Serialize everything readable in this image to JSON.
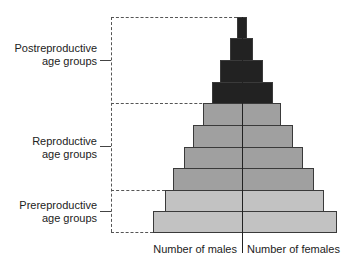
{
  "diagram": {
    "type": "age-structure-pyramid",
    "colors": {
      "postreproductive": "#222222",
      "reproductive": "#a0a0a0",
      "prereproductive": "#c2c2c2",
      "border": "#3a3a3a"
    },
    "groups": [
      {
        "key": "postreproductive",
        "line1": "Postreproductive",
        "line2": "age groups"
      },
      {
        "key": "reproductive",
        "line1": "Reproductive",
        "line2": "age groups"
      },
      {
        "key": "prereproductive",
        "line1": "Prereproductive",
        "line2": "age groups"
      }
    ],
    "axis_labels": {
      "left": "Number of males",
      "right": "Number of females"
    },
    "bars": [
      {
        "group": "postreproductive",
        "left": 237,
        "right": 247,
        "top": 17,
        "bottom": 38
      },
      {
        "group": "postreproductive",
        "left": 230,
        "right": 253,
        "top": 38,
        "bottom": 60
      },
      {
        "group": "postreproductive",
        "left": 220,
        "right": 263,
        "top": 60,
        "bottom": 82
      },
      {
        "group": "postreproductive",
        "left": 212,
        "right": 273,
        "top": 82,
        "bottom": 103
      },
      {
        "group": "reproductive",
        "left": 203,
        "right": 281,
        "top": 103,
        "bottom": 125
      },
      {
        "group": "reproductive",
        "left": 193,
        "right": 293,
        "top": 125,
        "bottom": 147
      },
      {
        "group": "reproductive",
        "left": 184,
        "right": 303,
        "top": 147,
        "bottom": 168
      },
      {
        "group": "reproductive",
        "left": 173,
        "right": 314,
        "top": 168,
        "bottom": 190
      },
      {
        "group": "prereproductive",
        "left": 165,
        "right": 324,
        "top": 190,
        "bottom": 211
      },
      {
        "group": "prereproductive",
        "left": 153,
        "right": 337,
        "top": 211,
        "bottom": 232
      }
    ]
  }
}
